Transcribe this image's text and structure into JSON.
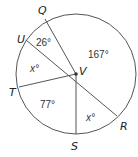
{
  "diagram": {
    "center": {
      "label": "V",
      "x": 76,
      "y": 74
    },
    "radius": 60,
    "points": [
      {
        "label": "Q",
        "x": 45,
        "y": 19,
        "lx": 38,
        "ly": 14
      },
      {
        "label": "U",
        "x": 26,
        "y": 40,
        "lx": 17,
        "ly": 41
      },
      {
        "label": "T",
        "x": 19,
        "y": 87,
        "lx": 9,
        "ly": 96
      },
      {
        "label": "S",
        "x": 76,
        "y": 134,
        "lx": 72,
        "ly": 150
      },
      {
        "label": "R",
        "x": 117,
        "y": 116,
        "lx": 120,
        "ly": 129
      }
    ],
    "angles": [
      {
        "label": "26°",
        "x": 35,
        "y": 44
      },
      {
        "label": "167°",
        "x": 89,
        "y": 57
      },
      {
        "label": "x°",
        "x": 29,
        "y": 71
      },
      {
        "label": "77°",
        "x": 41,
        "y": 107
      },
      {
        "label": "x°",
        "x": 86,
        "y": 120
      }
    ],
    "center_label": {
      "label": "V",
      "x": 79,
      "y": 73
    }
  }
}
